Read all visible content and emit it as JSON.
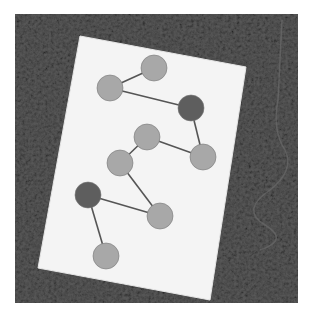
{
  "image": {
    "description": "Grayscale photograph of a white card on textured ground with nine circles connected by lines",
    "width": 309,
    "height": 317
  },
  "colors": {
    "background": "#ffffff",
    "ground": "#4a4a4a",
    "ground_light": "#7a7a7a",
    "card": "#f4f4f4",
    "circle_light": "#a8a8a8",
    "circle_dark": "#5e5e5e",
    "line": "#555555"
  },
  "card": {
    "points": "80,36 246,67 210,300 38,268"
  },
  "circles": [
    {
      "id": "c1",
      "cx": 154,
      "cy": 68,
      "r": 13,
      "shade": "light"
    },
    {
      "id": "c2",
      "cx": 110,
      "cy": 88,
      "r": 13,
      "shade": "light"
    },
    {
      "id": "c3",
      "cx": 191,
      "cy": 108,
      "r": 13,
      "shade": "dark"
    },
    {
      "id": "c4",
      "cx": 147,
      "cy": 137,
      "r": 13,
      "shade": "light"
    },
    {
      "id": "c5",
      "cx": 203,
      "cy": 157,
      "r": 13,
      "shade": "light"
    },
    {
      "id": "c6",
      "cx": 120,
      "cy": 163,
      "r": 13,
      "shade": "light"
    },
    {
      "id": "c7",
      "cx": 88,
      "cy": 195,
      "r": 13,
      "shade": "dark"
    },
    {
      "id": "c8",
      "cx": 160,
      "cy": 216,
      "r": 13,
      "shade": "light"
    },
    {
      "id": "c9",
      "cx": 106,
      "cy": 256,
      "r": 13,
      "shade": "light"
    }
  ],
  "links": [
    [
      "c1",
      "c2"
    ],
    [
      "c2",
      "c3"
    ],
    [
      "c3",
      "c5"
    ],
    [
      "c5",
      "c4"
    ],
    [
      "c4",
      "c6"
    ],
    [
      "c6",
      "c8"
    ],
    [
      "c8",
      "c7"
    ],
    [
      "c7",
      "c9"
    ]
  ]
}
